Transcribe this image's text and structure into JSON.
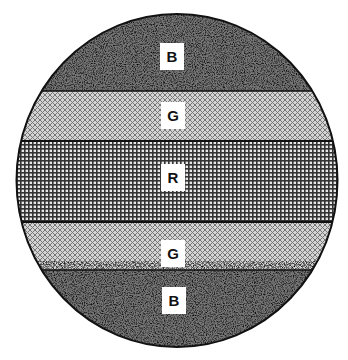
{
  "diagram": {
    "shape": "circle",
    "bands": [
      {
        "id": "top",
        "label": "B",
        "pattern": "stipple",
        "y_top": 14,
        "y_bottom": 91,
        "label_y": 43
      },
      {
        "id": "upper-middle",
        "label": "G",
        "pattern": "diagonal-crosshatch",
        "y_top": 91,
        "y_bottom": 141,
        "label_y": 102
      },
      {
        "id": "center",
        "label": "R",
        "pattern": "square-grid",
        "y_top": 141,
        "y_bottom": 222,
        "label_y": 163
      },
      {
        "id": "lower-middle",
        "label": "G",
        "pattern": "diagonal-crosshatch",
        "y_top": 222,
        "y_bottom": 270,
        "label_y": 240
      },
      {
        "id": "bottom",
        "label": "B",
        "pattern": "stipple",
        "y_top": 270,
        "y_bottom": 347,
        "label_y": 287
      }
    ],
    "colors": {
      "outline": "#111111",
      "background": "#ffffff"
    }
  }
}
